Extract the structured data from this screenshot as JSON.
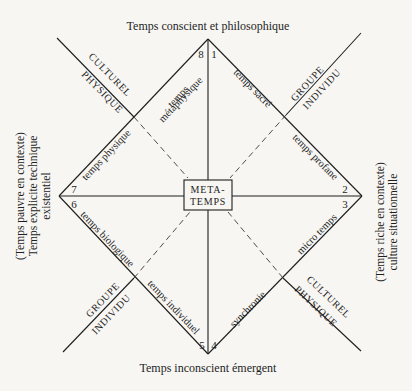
{
  "top_label": "Temps conscient et philosophique",
  "bottom_label": "Temps inconscient émergent",
  "left_label": {
    "line1": "(Temps pauvre en contexte)",
    "line2": "Temps explicite technique",
    "line3": "existentiel"
  },
  "right_label": {
    "line1": "(Temps riche en contexte)",
    "line2": "culture situationnelle"
  },
  "center_box": {
    "line1": "META-",
    "line2": "TEMPS"
  },
  "sectors": {
    "s1": "temps sacré",
    "s2": "temps profane",
    "s3": "micro temps",
    "s4": "synchronie",
    "s5": "temps individuel",
    "s6": "temps biologique",
    "s7": "temps physique",
    "s8_line1": "temps",
    "s8_line2": "métaphysique"
  },
  "numbers": [
    "1",
    "2",
    "3",
    "4",
    "5",
    "6",
    "7",
    "8"
  ],
  "axis_pairs": {
    "top_left": {
      "outer": "CULTUREL",
      "inner": "PHYSIQUE"
    },
    "top_right": {
      "outer": "GROUPE",
      "inner": "INDIVIDU"
    },
    "bottom_left": {
      "outer": "GROUPE",
      "inner": "INDIVIDU"
    },
    "bottom_right": {
      "outer": "CULTUREL",
      "inner": "PHYSIQUE"
    }
  },
  "colors": {
    "ink": "#1e1e1e",
    "paper": "#f7f6f3"
  }
}
